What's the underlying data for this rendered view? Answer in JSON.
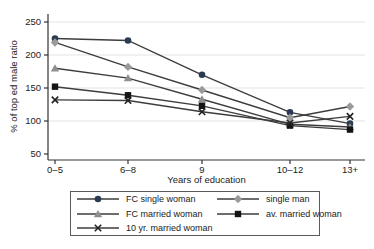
{
  "chart_data": {
    "type": "line",
    "title": "",
    "xlabel": "Years of education",
    "ylabel": "% of top ed male ratio",
    "categories": [
      "0–5",
      "6–8",
      "9",
      "10–12",
      "13+"
    ],
    "ylim": [
      50,
      250
    ],
    "yticks": [
      50,
      100,
      150,
      200,
      250
    ],
    "gridlines": [
      100,
      150,
      200,
      250
    ],
    "grid": "horizontal",
    "legend_position": "bottom",
    "line_color": "#3d3d3d",
    "grid_color": "#e3e3e3",
    "axis_color": "#333333",
    "series": [
      {
        "name": "FC single woman",
        "marker": "circle",
        "color": "#2b3b52",
        "values": [
          225,
          222,
          170,
          113,
          96
        ]
      },
      {
        "name": "single man",
        "marker": "diamond",
        "color": "#9a9a9a",
        "values": [
          219,
          182,
          147,
          105,
          122
        ]
      },
      {
        "name": "FC married woman",
        "marker": "triangle",
        "color": "#8f8f8f",
        "values": [
          180,
          165,
          133,
          95,
          91
        ]
      },
      {
        "name": "av. married woman",
        "marker": "square",
        "color": "#141414",
        "values": [
          152,
          139,
          123,
          93,
          87
        ]
      },
      {
        "name": "10 yr. married woman",
        "marker": "x",
        "color": "#222222",
        "values": [
          132,
          131,
          114,
          97,
          107
        ]
      }
    ]
  }
}
